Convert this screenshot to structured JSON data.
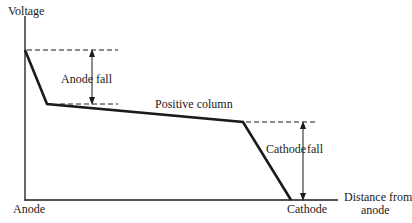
{
  "diagram": {
    "y_axis_label": "Voltage",
    "x_axis_label_line1": "Distance from",
    "x_axis_label_line2": "anode",
    "anode_label": "Anode",
    "cathode_label": "Cathode",
    "anode_fall_word1": "Anode",
    "anode_fall_word2": "fall",
    "positive_column_label": "Positive column",
    "cathode_fall_word1": "Cathode",
    "cathode_fall_word2": "fall",
    "colors": {
      "line": "#1a1a1a",
      "background": "#ffffff"
    }
  }
}
